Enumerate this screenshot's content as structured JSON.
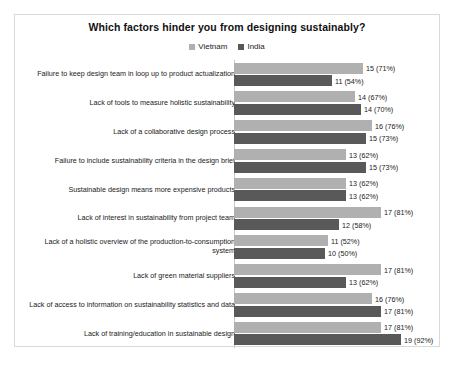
{
  "chart_data": {
    "type": "bar",
    "orientation": "horizontal",
    "title": "Which factors hinder you from designing sustainably?",
    "xlabel": "",
    "ylabel": "",
    "grid": false,
    "legend_position": "top-center",
    "xlim": [
      0,
      100
    ],
    "value_label_format": "count (percent)",
    "categories": [
      "Failure to keep design team in loop up to product actualization",
      "Lack of tools to measure holistic sustainability",
      "Lack of a collaborative design process",
      "Failure to include sustainability criteria in the design brief",
      "Sustainable design means more expensive products",
      "Lack of interest in sustainability from project team",
      "Lack of a holistic overview of the production-to-consumption system",
      "Lack of green material suppliers",
      "Lack of access to information on sustainability statistics and data",
      "Lack of training/education in sustainable design"
    ],
    "series": [
      {
        "name": "Vietnam",
        "color": "#b0b0b0",
        "values": [
          15,
          14,
          16,
          13,
          13,
          17,
          11,
          17,
          16,
          17
        ],
        "percents": [
          71,
          67,
          76,
          62,
          62,
          81,
          52,
          81,
          76,
          81
        ],
        "labels": [
          "15 (71%)",
          "14 (67%)",
          "16 (76%)",
          "13 (62%)",
          "13 (62%)",
          "17 (81%)",
          "11 (52%)",
          "17 (81%)",
          "16 (76%)",
          "17 (81%)"
        ]
      },
      {
        "name": "India",
        "color": "#595959",
        "values": [
          11,
          14,
          15,
          15,
          13,
          12,
          10,
          13,
          17,
          19
        ],
        "percents": [
          54,
          70,
          73,
          73,
          62,
          58,
          50,
          62,
          81,
          92
        ],
        "labels": [
          "11 (54%)",
          "14 (70%)",
          "15 (73%)",
          "15 (73%)",
          "13 (62%)",
          "12 (58%)",
          "10 (50%)",
          "13 (62%)",
          "17 (81%)",
          "19 (92%)"
        ]
      }
    ]
  }
}
